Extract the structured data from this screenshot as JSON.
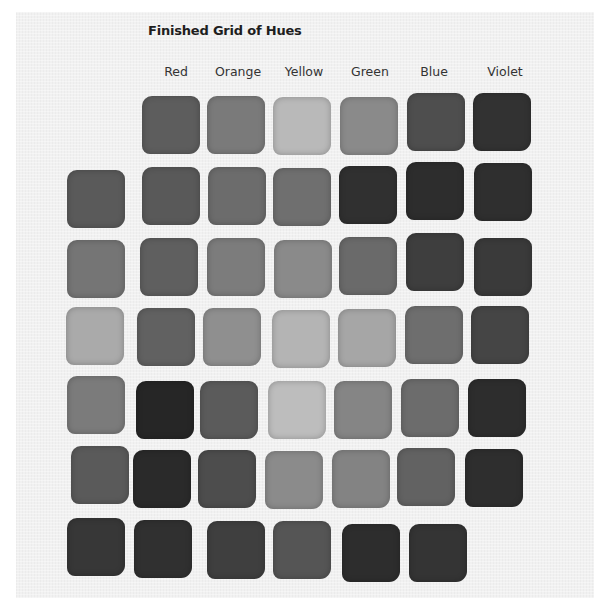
{
  "title": "Finished Grid of Hues",
  "columns": [
    {
      "label": "Red",
      "x": 176
    },
    {
      "label": "Orange",
      "x": 238
    },
    {
      "label": "Yellow",
      "x": 304
    },
    {
      "label": "Green",
      "x": 370
    },
    {
      "label": "Blue",
      "x": 434
    },
    {
      "label": "Violet",
      "x": 505
    }
  ],
  "swatches": [
    {
      "row": 0,
      "col": "Red",
      "x": 142,
      "y": 96,
      "tone": "#5d5d5d"
    },
    {
      "row": 0,
      "col": "Orange",
      "x": 207,
      "y": 96,
      "tone": "#7a7a7a"
    },
    {
      "row": 0,
      "col": "Yellow",
      "x": 273,
      "y": 97,
      "tone": "#b9b9b9"
    },
    {
      "row": 0,
      "col": "Green",
      "x": 340,
      "y": 97,
      "tone": "#8a8a8a"
    },
    {
      "row": 0,
      "col": "Blue",
      "x": 407,
      "y": 93,
      "tone": "#4e4e4e"
    },
    {
      "row": 0,
      "col": "Violet",
      "x": 473,
      "y": 93,
      "tone": "#323232"
    },
    {
      "row": 1,
      "col": "Base",
      "x": 67,
      "y": 170,
      "tone": "#5a5a5a"
    },
    {
      "row": 1,
      "col": "Red",
      "x": 142,
      "y": 167,
      "tone": "#595959"
    },
    {
      "row": 1,
      "col": "Orange",
      "x": 208,
      "y": 167,
      "tone": "#6c6c6c"
    },
    {
      "row": 1,
      "col": "Yellow",
      "x": 273,
      "y": 168,
      "tone": "#6f6f6f"
    },
    {
      "row": 1,
      "col": "Green",
      "x": 339,
      "y": 166,
      "tone": "#303030"
    },
    {
      "row": 1,
      "col": "Blue",
      "x": 406,
      "y": 162,
      "tone": "#2d2d2d"
    },
    {
      "row": 1,
      "col": "Violet",
      "x": 474,
      "y": 163,
      "tone": "#2f2f2f"
    },
    {
      "row": 2,
      "col": "Base",
      "x": 67,
      "y": 240,
      "tone": "#757575"
    },
    {
      "row": 2,
      "col": "Red",
      "x": 140,
      "y": 238,
      "tone": "#5f5f5f"
    },
    {
      "row": 2,
      "col": "Orange",
      "x": 207,
      "y": 238,
      "tone": "#7c7c7c"
    },
    {
      "row": 2,
      "col": "Yellow",
      "x": 274,
      "y": 240,
      "tone": "#8a8a8a"
    },
    {
      "row": 2,
      "col": "Green",
      "x": 339,
      "y": 237,
      "tone": "#6a6a6a"
    },
    {
      "row": 2,
      "col": "Blue",
      "x": 406,
      "y": 233,
      "tone": "#3e3e3e"
    },
    {
      "row": 2,
      "col": "Violet",
      "x": 474,
      "y": 238,
      "tone": "#3a3a3a"
    },
    {
      "row": 3,
      "col": "Base",
      "x": 66,
      "y": 307,
      "tone": "#aaaaaa"
    },
    {
      "row": 3,
      "col": "Red",
      "x": 137,
      "y": 308,
      "tone": "#616161"
    },
    {
      "row": 3,
      "col": "Orange",
      "x": 203,
      "y": 308,
      "tone": "#8f8f8f"
    },
    {
      "row": 3,
      "col": "Yellow",
      "x": 272,
      "y": 310,
      "tone": "#b4b4b4"
    },
    {
      "row": 3,
      "col": "Green",
      "x": 338,
      "y": 309,
      "tone": "#a6a6a6"
    },
    {
      "row": 3,
      "col": "Blue",
      "x": 405,
      "y": 306,
      "tone": "#6e6e6e"
    },
    {
      "row": 3,
      "col": "Violet",
      "x": 471,
      "y": 306,
      "tone": "#454545"
    },
    {
      "row": 4,
      "col": "Base",
      "x": 67,
      "y": 376,
      "tone": "#7b7b7b"
    },
    {
      "row": 4,
      "col": "Red",
      "x": 136,
      "y": 381,
      "tone": "#262626"
    },
    {
      "row": 4,
      "col": "Orange",
      "x": 200,
      "y": 381,
      "tone": "#5b5b5b"
    },
    {
      "row": 4,
      "col": "Yellow",
      "x": 268,
      "y": 381,
      "tone": "#bdbdbd"
    },
    {
      "row": 4,
      "col": "Green",
      "x": 334,
      "y": 381,
      "tone": "#858585"
    },
    {
      "row": 4,
      "col": "Blue",
      "x": 401,
      "y": 379,
      "tone": "#6c6c6c"
    },
    {
      "row": 4,
      "col": "Violet",
      "x": 468,
      "y": 379,
      "tone": "#2d2d2d"
    },
    {
      "row": 5,
      "col": "Base",
      "x": 71,
      "y": 446,
      "tone": "#5a5a5a"
    },
    {
      "row": 5,
      "col": "Red",
      "x": 133,
      "y": 450,
      "tone": "#2a2a2a"
    },
    {
      "row": 5,
      "col": "Orange",
      "x": 198,
      "y": 450,
      "tone": "#4d4d4d"
    },
    {
      "row": 5,
      "col": "Yellow",
      "x": 265,
      "y": 451,
      "tone": "#8b8b8b"
    },
    {
      "row": 5,
      "col": "Green",
      "x": 332,
      "y": 450,
      "tone": "#838383"
    },
    {
      "row": 5,
      "col": "Blue",
      "x": 397,
      "y": 448,
      "tone": "#626262"
    },
    {
      "row": 5,
      "col": "Violet",
      "x": 465,
      "y": 449,
      "tone": "#2e2e2e"
    },
    {
      "row": 6,
      "col": "Base",
      "x": 67,
      "y": 518,
      "tone": "#373737"
    },
    {
      "row": 6,
      "col": "Red",
      "x": 134,
      "y": 520,
      "tone": "#303030"
    },
    {
      "row": 6,
      "col": "Orange",
      "x": 207,
      "y": 521,
      "tone": "#3f3f3f"
    },
    {
      "row": 6,
      "col": "Yellow",
      "x": 273,
      "y": 521,
      "tone": "#555555"
    },
    {
      "row": 6,
      "col": "Green",
      "x": 342,
      "y": 524,
      "tone": "#2d2d2d"
    },
    {
      "row": 6,
      "col": "Blue",
      "x": 409,
      "y": 524,
      "tone": "#343434"
    }
  ]
}
